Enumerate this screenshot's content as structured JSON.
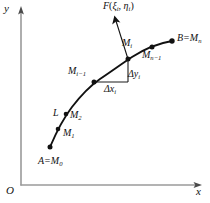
{
  "figure": {
    "type": "math-diagram",
    "background_color": "#ffffff",
    "ink_color": "#111111",
    "axis_color": "#8c8c8c"
  },
  "axes": {
    "y_label": "y",
    "x_label": "x",
    "origin_label": "O"
  },
  "vector": {
    "label_function": "F",
    "label_open": "(",
    "label_xi": "ξ",
    "label_xi_sub": "i",
    "label_comma": ", ",
    "label_eta": "η",
    "label_eta_sub": "i",
    "label_close": ")",
    "label_full": "F(ξi, ξi)"
  },
  "curve": {
    "name_label": "L",
    "path": "M 50 147 C 56 133 62 120 72 107 C 82 94 90 86 100 79 C 112 71 120 65 132 57 C 146 48 160 43 172 41"
  },
  "points": [
    {
      "id": "A",
      "label_letter": "A",
      "label_eq": "=M",
      "label_sub": "0",
      "x": 50,
      "y": 147
    },
    {
      "id": "M1",
      "label_letter": "",
      "label_eq": "M",
      "label_sub": "1",
      "x": 58,
      "y": 129
    },
    {
      "id": "M2",
      "label_letter": "",
      "label_eq": "M",
      "label_sub": "2",
      "x": 66,
      "y": 114
    },
    {
      "id": "Mi1",
      "label_letter": "",
      "label_eq": "M",
      "label_sub": "i−1",
      "x": 94,
      "y": 82
    },
    {
      "id": "Mi",
      "label_letter": "",
      "label_eq": "M",
      "label_sub": "i",
      "x": 128,
      "y": 59
    },
    {
      "id": "Mn1",
      "label_letter": "",
      "label_eq": "M",
      "label_sub": "n−1",
      "x": 152,
      "y": 47
    },
    {
      "id": "B",
      "label_letter": "B",
      "label_eq": "=M",
      "label_sub": "n",
      "x": 172,
      "y": 41
    }
  ],
  "labels": {
    "m_i": "M",
    "m_i_sub": "i",
    "m_i_minus_1": "M",
    "m_i_minus_1_sub": "i−1",
    "m_n_minus_1": "M",
    "m_n_minus_1_sub": "n−1",
    "b_prefix": "B",
    "b_eq": "=M",
    "b_sub": "n",
    "a_prefix": "A",
    "a_eq": "=M",
    "a_sub": "0",
    "m1": "M",
    "m1_sub": "1",
    "m2": "M",
    "m2_sub": "2",
    "curve_name": "L",
    "delta_y": "Δy",
    "delta_y_sub": "i",
    "delta_x": "Δx",
    "delta_x_sub": "i"
  },
  "increment_triangle": {
    "corner_x": 94,
    "corner_y": 82,
    "right_angle_x": 128,
    "right_angle_y": 82,
    "top_x": 128,
    "top_y": 59,
    "delta_x_label": "Δxi",
    "delta_y_label": "Δyi"
  }
}
